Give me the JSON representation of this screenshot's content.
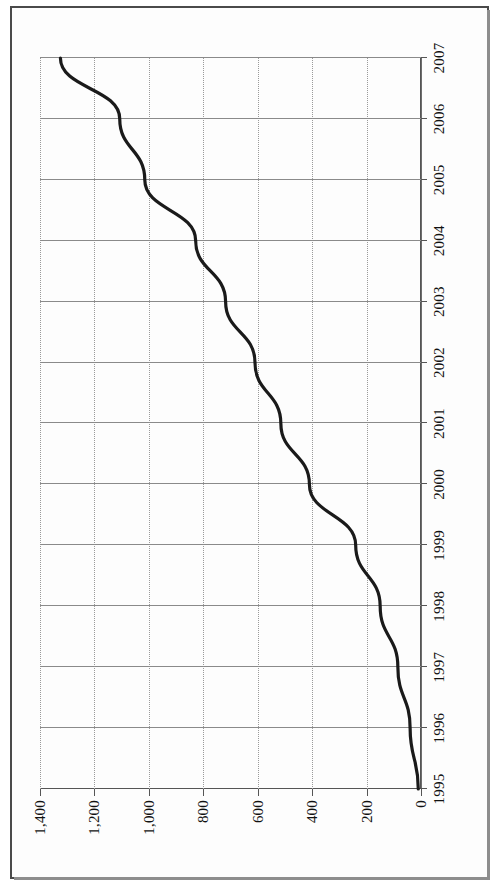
{
  "page": {
    "background_color": "#ffffff",
    "frame_color": "#4a4a4a"
  },
  "chart_data": {
    "type": "line",
    "title": "",
    "subtitle": "",
    "xlabel": "",
    "ylabel": "",
    "orientation": "rotated-90-ccw",
    "grid": true,
    "legend": "none",
    "categories": [
      "1995",
      "1996",
      "1997",
      "1998",
      "1999",
      "2000",
      "2001",
      "2002",
      "2003",
      "2004",
      "2005",
      "2006",
      "2007"
    ],
    "x": [
      1995,
      1996,
      1997,
      1998,
      1999,
      2000,
      2001,
      2002,
      2003,
      2004,
      2005,
      2006,
      2007
    ],
    "values": [
      10,
      40,
      85,
      150,
      240,
      410,
      515,
      610,
      718,
      828,
      1015,
      1107,
      1325
    ],
    "series": [
      {
        "name": "series-1",
        "color": "#1a1a1a",
        "values": [
          10,
          40,
          85,
          150,
          240,
          410,
          515,
          610,
          718,
          828,
          1015,
          1107,
          1325
        ]
      }
    ],
    "ylim": [
      0,
      1400
    ],
    "ytick_values": [
      0,
      200,
      400,
      600,
      800,
      1000,
      1200,
      1400
    ],
    "ytick_labels": [
      "0",
      "200",
      "400",
      "600",
      "800",
      "1,000",
      "1,200",
      "1,400"
    ],
    "xtick_labels": [
      "1995",
      "1996",
      "1997",
      "1998",
      "1999",
      "2000",
      "2001",
      "2002",
      "2003",
      "2004",
      "2005",
      "2006",
      "2007"
    ]
  }
}
